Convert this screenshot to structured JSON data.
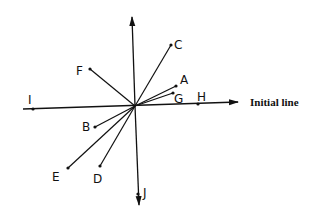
{
  "diagram": {
    "caption": "Initial line",
    "origin": {
      "x": 135,
      "y": 106
    },
    "points": [
      {
        "label": "A",
        "x": 176,
        "y": 86,
        "lx": 180,
        "ly": 84
      },
      {
        "label": "B",
        "x": 95,
        "y": 127,
        "lx": 82,
        "ly": 131
      },
      {
        "label": "C",
        "x": 171,
        "y": 45,
        "lx": 174,
        "ly": 49
      },
      {
        "label": "D",
        "x": 100,
        "y": 166,
        "lx": 93,
        "ly": 183
      },
      {
        "label": "E",
        "x": 68,
        "y": 168,
        "lx": 52,
        "ly": 181
      },
      {
        "label": "F",
        "x": 90,
        "y": 69,
        "lx": 76,
        "ly": 75
      },
      {
        "label": "G",
        "x": 173,
        "y": 93,
        "lx": 174,
        "ly": 103
      },
      {
        "label": "H",
        "x": 198,
        "y": 104,
        "lx": 197,
        "ly": 101
      },
      {
        "label": "I",
        "x": 33,
        "y": 109,
        "lx": 28,
        "ly": 104
      },
      {
        "label": "J",
        "x": 138,
        "y": 194,
        "lx": 143,
        "ly": 197
      }
    ]
  }
}
